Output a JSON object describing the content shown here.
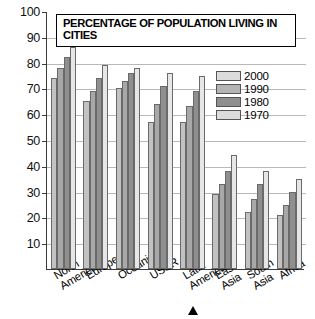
{
  "chart_data": {
    "type": "bar",
    "title": "PERCENTAGE OF POPULATION LIVING IN CITIES",
    "xlabel": "",
    "ylabel": "",
    "ylim": [
      0,
      100
    ],
    "yticks": [
      10,
      20,
      30,
      40,
      50,
      60,
      70,
      80,
      90,
      100
    ],
    "grid": true,
    "legend_position": "top-right",
    "categories": [
      "North America",
      "Europe",
      "Oceania",
      "USSR",
      "Latin America",
      "East Asia",
      "South Asia",
      "Africa"
    ],
    "series": [
      {
        "name": "2000",
        "color": "#c2c2c2",
        "values": [
          74,
          65,
          70,
          57,
          57,
          29,
          22,
          21
        ]
      },
      {
        "name": "1990",
        "color": "#a8a8a8",
        "values": [
          78,
          69,
          73,
          64,
          63,
          33,
          27,
          25
        ]
      },
      {
        "name": "1980",
        "color": "#8f8f8f",
        "values": [
          82,
          74,
          76,
          71,
          69,
          38,
          33,
          30
        ]
      },
      {
        "name": "1970",
        "color": "#e6e6e6",
        "values": [
          86,
          79,
          78,
          76,
          75,
          44,
          38,
          35
        ]
      }
    ],
    "annotations": [
      {
        "name": "pointer-marker",
        "target_category": "Latin America",
        "shape": "triangle-up"
      }
    ]
  },
  "legend": {
    "entries": [
      "2000",
      "1990",
      "1980",
      "1970"
    ]
  },
  "category_lines": [
    [
      "North",
      "America"
    ],
    [
      "Europe",
      ""
    ],
    [
      "Oceania",
      ""
    ],
    [
      "USSR",
      ""
    ],
    [
      "Latin",
      "America"
    ],
    [
      "East",
      "Asia"
    ],
    [
      "South",
      "Asia"
    ],
    [
      "Africa",
      ""
    ]
  ]
}
